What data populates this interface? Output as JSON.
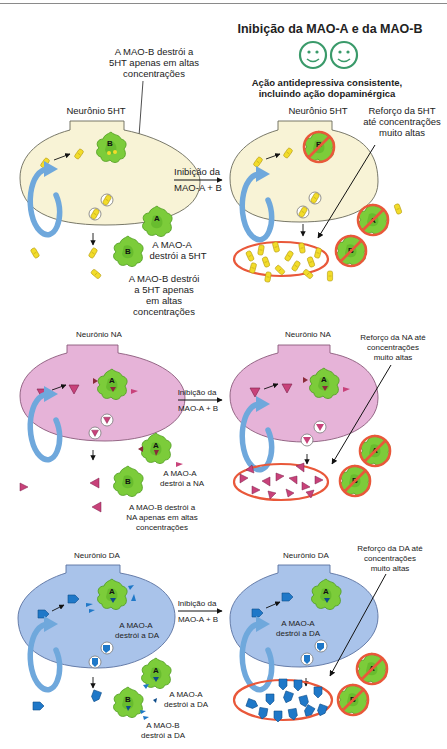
{
  "header": {
    "title": "Inibição da MAO-A e da MAO-B",
    "subtitle_line1": "Ação antidepressiva consistente,",
    "subtitle_line2": "incluindo ação dopaminérgica",
    "smiley_icons": [
      "smiley-face-icon",
      "smiley-face-icon"
    ],
    "smiley_color": "#3a9a6a"
  },
  "arrow_label": {
    "line1": "Inibição da",
    "line2": "MAO-A + B"
  },
  "colors": {
    "serotonin_neuron": "#f8f3d6",
    "na_neuron": "#e6b3d8",
    "da_neuron": "#a9c3ea",
    "enzyme_green": "#7ccc3a",
    "inhibit_red": "#e9583a",
    "reuptake_blue": "#6fa8dc",
    "serotonin_molecule": "#f2dc2a",
    "na_molecule": "#c8427a",
    "da_molecule": "#1f78c8"
  },
  "panels": {
    "serotonin": {
      "left": {
        "neuron_label": "Neurônio 5HT",
        "mao_b_inside_l1": "A MAO-B destrói a",
        "mao_b_inside_l2": "5HT apenas em altas",
        "mao_b_inside_l3": "concentrações",
        "mao_a_l1": "A MAO-A",
        "mao_a_l2": "destrói a 5HT",
        "mao_b_out_l1": "A MAO-B destrói",
        "mao_b_out_l2": "a 5HT apenas",
        "mao_b_out_l3": "em altas",
        "mao_b_out_l4": "concentrações",
        "enzyme_inside": "B",
        "enzyme_a": "A",
        "enzyme_b": "B"
      },
      "right": {
        "neuron_label": "Neurônio 5HT",
        "boost_l1": "Reforço da 5HT",
        "boost_l2": "até concentrações",
        "boost_l3": "muito altas",
        "enzyme_inside": "B",
        "enzyme_a": "A",
        "enzyme_b": "B"
      }
    },
    "noradrenaline": {
      "left": {
        "neuron_label": "Neurônio NA",
        "mao_a_l1": "A MAO-A",
        "mao_a_l2": "destrói a NA",
        "mao_b_l1": "A MAO-B destrói a",
        "mao_b_l2": "NA apenas em altas",
        "mao_b_l3": "concentrações",
        "enzyme_inside": "A",
        "enzyme_a": "A",
        "enzyme_b": "B"
      },
      "right": {
        "neuron_label": "Neurônio NA",
        "boost_l1": "Reforço da NA até",
        "boost_l2": "concentrações",
        "boost_l3": "muito altas",
        "enzyme_inside": "A",
        "enzyme_a": "A",
        "enzyme_b": "B"
      }
    },
    "dopamine": {
      "left": {
        "neuron_label": "Neurônio DA",
        "mao_a_inside_l1": "A MAO-A",
        "mao_a_inside_l2": "destrói a DA",
        "mao_a_l1": "A MAO-A",
        "mao_a_l2": "destrói a DA",
        "mao_b_l1": "A MAO-B",
        "mao_b_l2": "destrói a DA",
        "enzyme_inside": "A",
        "enzyme_a": "A",
        "enzyme_b": "B"
      },
      "right": {
        "neuron_label": "Neurônio DA",
        "mao_a_inside_l1": "A MAO-A",
        "mao_a_inside_l2": "destrói a DA",
        "boost_l1": "Reforço da DA até",
        "boost_l2": "concentrações",
        "boost_l3": "muito altas",
        "enzyme_inside": "A",
        "enzyme_a": "A",
        "enzyme_b": "B"
      }
    }
  }
}
